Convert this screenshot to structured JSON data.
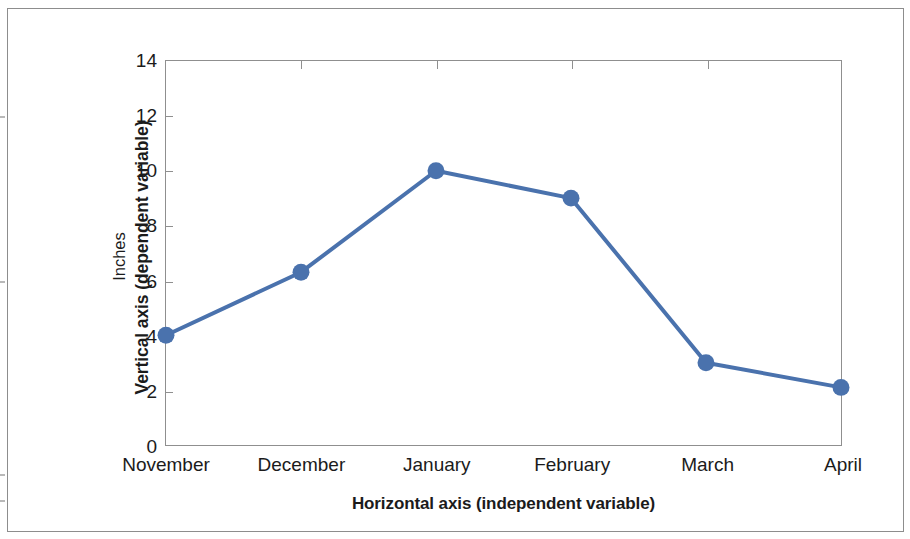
{
  "chart_data": {
    "type": "line",
    "title": "",
    "subtitle": "",
    "xlabel": "Horizontal axis (independent variable)",
    "ylabel": "Inches",
    "ylabel_outer": "Vertical axis (dependent variable)",
    "categories": [
      "November",
      "December",
      "January",
      "February",
      "March",
      "April"
    ],
    "values": [
      4.0,
      6.3,
      10.0,
      9.0,
      3.0,
      2.1
    ],
    "series": [
      {
        "name": "Inches",
        "values": [
          4.0,
          6.3,
          10.0,
          9.0,
          3.0,
          2.1
        ],
        "color": "#4a72ad",
        "marker": "circle"
      }
    ],
    "ylim": [
      0,
      14
    ],
    "ytick_step": 2,
    "ytick_labels": [
      "14",
      "12",
      "10",
      "8",
      "6",
      "4",
      "2",
      "0"
    ],
    "ytick_values": [
      14,
      12,
      10,
      8,
      6,
      4,
      2,
      0
    ],
    "grid": false,
    "legend": false,
    "legend_position": "none",
    "annotations": []
  },
  "style": {
    "line_color": "#4a72ad",
    "marker_color": "#4a72ad",
    "axis_color": "#8f8f8f",
    "frame_color": "#8d8d8d",
    "text_color": "#1b1b1b",
    "background": "#ffffff"
  },
  "icons": {
    "data_point": "circle-marker-icon"
  }
}
